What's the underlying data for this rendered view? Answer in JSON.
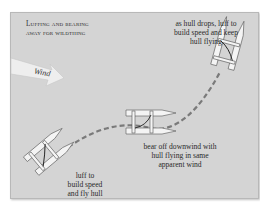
{
  "diagram": {
    "title_line1": "Luffing and bearing",
    "title_line2": "away for wildthing",
    "wind_label": "Wind",
    "annotations": {
      "top_right": [
        "as hull drops, luff to",
        "build speed and keep",
        "hull flying"
      ],
      "middle": [
        "bear off downwind with",
        "hull flying in same",
        "apparent wind"
      ],
      "bottom_left": [
        "luff to",
        "build speed",
        "and fly hull"
      ]
    },
    "colors": {
      "panel_bg": "#d4d4d4",
      "panel_border": "#b8b8b8",
      "path_dash": "#7a7a7a",
      "hull_fill": "#f4f4f4",
      "outline": "#555555",
      "wind_arrow": "#eeeeee"
    }
  }
}
